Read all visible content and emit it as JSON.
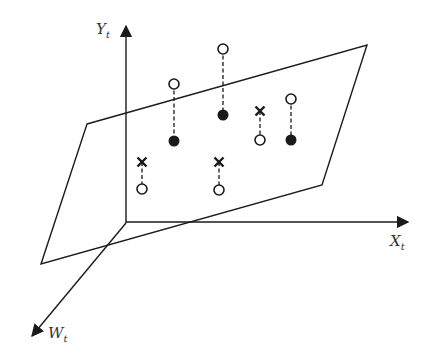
{
  "diagram": {
    "axes": {
      "y": {
        "label": "Y",
        "subscript": "t"
      },
      "x": {
        "label": "X",
        "subscript": "t"
      },
      "w": {
        "label": "W",
        "subscript": "t"
      }
    },
    "colors": {
      "stroke": "#1a1a1a",
      "label": "#333333",
      "background": "#ffffff"
    },
    "legend_semantics": {
      "open-circle": "observed value",
      "filled-circle": "fitted value on plane (observed above)",
      "cross": "fitted value on plane (observed below)"
    },
    "point_groups": [
      {
        "x": 174,
        "top": {
          "type": "open",
          "y": 84
        },
        "bottom": {
          "type": "filled",
          "y": 141
        }
      },
      {
        "x": 223,
        "top": {
          "type": "open",
          "y": 49
        },
        "bottom": {
          "type": "filled",
          "y": 115
        }
      },
      {
        "x": 260,
        "top": {
          "type": "cross",
          "y": 111
        },
        "bottom": {
          "type": "open",
          "y": 140
        }
      },
      {
        "x": 291,
        "top": {
          "type": "open",
          "y": 99
        },
        "bottom": {
          "type": "filled",
          "y": 140
        }
      },
      {
        "x": 142,
        "top": {
          "type": "cross",
          "y": 162
        },
        "bottom": {
          "type": "open",
          "y": 189
        }
      },
      {
        "x": 219,
        "top": {
          "type": "cross",
          "y": 162
        },
        "bottom": {
          "type": "open",
          "y": 190
        }
      }
    ]
  }
}
